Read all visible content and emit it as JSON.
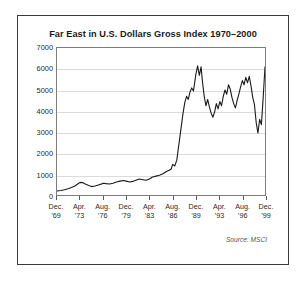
{
  "figure": {
    "title": "Far East in U.S. Dollars Gross Index 1970–2000",
    "source_note": "Source: MSCI",
    "frame_color": "#3b3b3b",
    "line_color": "#1a1a1a",
    "grid_color": "#dcdcdc",
    "background": "#ffffff"
  },
  "chart_data": {
    "type": "line",
    "title": "Far East in U.S. Dollars Gross Index 1970–2000",
    "subtitle": "",
    "xlabel": "",
    "ylabel": "",
    "annotations": [
      "Source: MSCI"
    ],
    "grid": true,
    "legend": false,
    "legend_position": "none",
    "ylim": [
      0,
      7000
    ],
    "ytick_labels": [
      "0",
      "1000",
      "2000",
      "3000",
      "4000",
      "5000",
      "6000",
      "7000"
    ],
    "ytick_values": [
      0,
      1000,
      2000,
      3000,
      4000,
      5000,
      6000,
      7000
    ],
    "xlim": [
      "Dec. '69",
      "Dec. '99"
    ],
    "xtick_labels": [
      {
        "month": "Dec.",
        "year": "’69"
      },
      {
        "month": "Apr.",
        "year": "’73"
      },
      {
        "month": "Aug.",
        "year": "’76"
      },
      {
        "month": "Dec.",
        "year": "’79"
      },
      {
        "month": "Apr.",
        "year": "’83"
      },
      {
        "month": "Aug.",
        "year": "’86"
      },
      {
        "month": "Dec.",
        "year": "’89"
      },
      {
        "month": "Apr.",
        "year": "’93"
      },
      {
        "month": "Aug.",
        "year": "’96"
      },
      {
        "month": "Dec.",
        "year": "’99"
      }
    ],
    "series": [
      {
        "name": "Far East in U.S. Dollars Gross Index",
        "x": [
          1969.92,
          1970.5,
          1971.0,
          1971.5,
          1972.0,
          1972.5,
          1972.9,
          1973.25,
          1973.6,
          1974.0,
          1974.5,
          1974.9,
          1975.4,
          1975.9,
          1976.4,
          1976.6,
          1977.0,
          1977.5,
          1978.0,
          1978.5,
          1979.0,
          1979.5,
          1979.9,
          1980.4,
          1980.9,
          1981.3,
          1981.8,
          1982.3,
          1982.8,
          1983.25,
          1983.7,
          1984.2,
          1984.7,
          1985.2,
          1985.7,
          1986.1,
          1986.4,
          1986.6,
          1986.9,
          1987.2,
          1987.45,
          1987.7,
          1987.9,
          1988.1,
          1988.35,
          1988.6,
          1988.85,
          1989.1,
          1989.35,
          1989.6,
          1989.8,
          1989.95,
          1990.2,
          1990.45,
          1990.7,
          1990.9,
          1991.15,
          1991.4,
          1991.65,
          1991.9,
          1992.15,
          1992.4,
          1992.65,
          1992.9,
          1993.15,
          1993.4,
          1993.65,
          1993.9,
          1994.15,
          1994.4,
          1994.65,
          1994.9,
          1995.15,
          1995.4,
          1995.65,
          1995.9,
          1996.15,
          1996.4,
          1996.65,
          1996.9,
          1997.15,
          1997.4,
          1997.65,
          1997.9,
          1998.15,
          1998.4,
          1998.65,
          1998.9,
          1999.15,
          1999.4,
          1999.65,
          1999.92
        ],
        "y": [
          190,
          215,
          250,
          300,
          360,
          430,
          520,
          600,
          590,
          520,
          450,
          400,
          430,
          480,
          530,
          560,
          540,
          520,
          560,
          620,
          660,
          690,
          660,
          620,
          650,
          700,
          760,
          730,
          700,
          760,
          860,
          900,
          940,
          1010,
          1120,
          1180,
          1240,
          1460,
          1380,
          1660,
          2300,
          2900,
          3400,
          3900,
          4400,
          4700,
          4550,
          4900,
          5100,
          4950,
          5400,
          5750,
          6150,
          5700,
          6100,
          5400,
          4700,
          4250,
          4550,
          4200,
          3900,
          3700,
          3950,
          4350,
          4100,
          4450,
          4250,
          4700,
          5000,
          4800,
          5250,
          5050,
          4650,
          4350,
          4150,
          4500,
          4800,
          5150,
          5450,
          5250,
          5600,
          5350,
          5650,
          5200,
          4650,
          4300,
          3450,
          2950,
          3600,
          3350,
          4600,
          6100
        ]
      }
    ]
  }
}
